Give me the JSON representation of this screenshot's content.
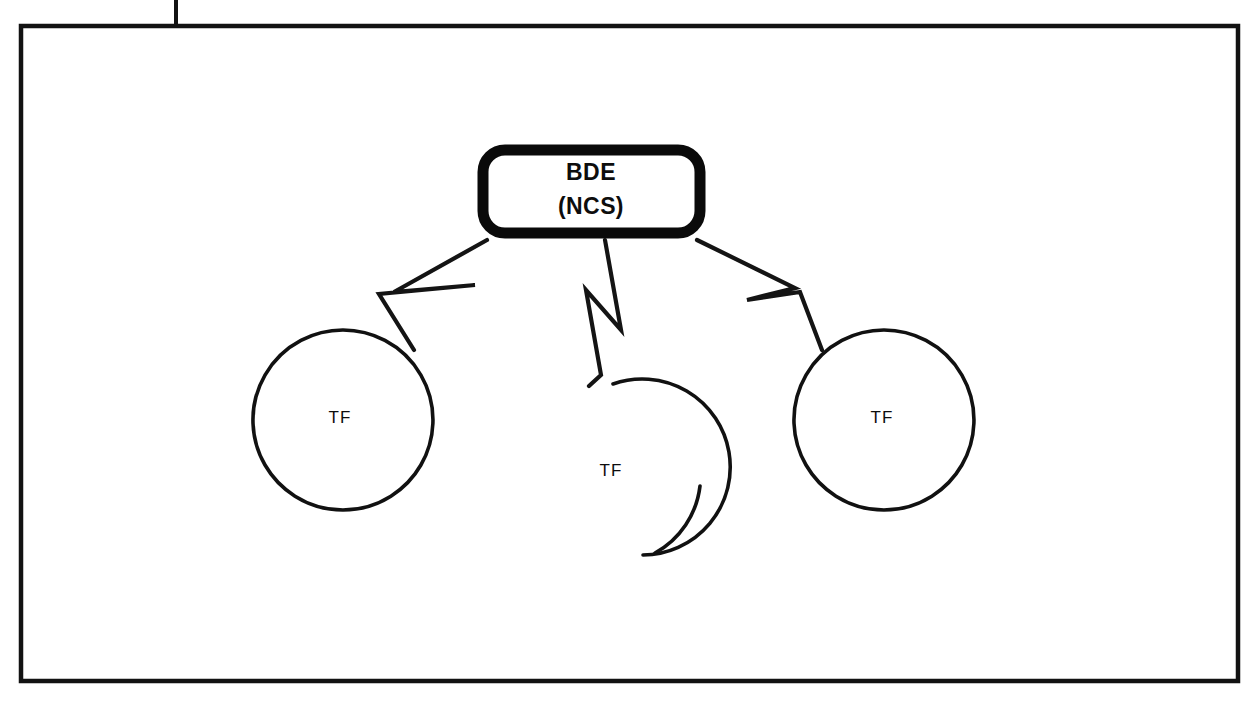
{
  "figure": {
    "kind": "network-topology-diagram",
    "frame": {
      "visible": true,
      "stub_at_top": true,
      "stroke_color": "#121212"
    },
    "colors": {
      "ink": "#111111",
      "paper": "#ffffff",
      "node_border": "#0a0a0a"
    }
  },
  "nodes": {
    "control_station": {
      "id": "bde-ncs",
      "shape": "rounded-rectangle",
      "emphasis": "thick-border",
      "line1": "BDE",
      "line2": "(NCS)",
      "x": 591,
      "y": 191,
      "width": 227,
      "height": 93
    },
    "subscribers": [
      {
        "id": "tf-left",
        "shape": "circle",
        "label": "TF",
        "cx": 343,
        "cy": 420,
        "r": 90
      },
      {
        "id": "tf-center",
        "shape": "circle",
        "label": "TF",
        "cx": 613,
        "cy": 472,
        "r": 88
      },
      {
        "id": "tf-right",
        "shape": "circle",
        "label": "TF",
        "cx": 884,
        "cy": 420,
        "r": 90
      }
    ]
  },
  "links": [
    {
      "id": "link-bde-tf-left",
      "from": "bde-ncs",
      "to": "tf-left",
      "style": "lightning-bolt",
      "meaning": "radio link"
    },
    {
      "id": "link-bde-tf-center",
      "from": "bde-ncs",
      "to": "tf-center",
      "style": "lightning-bolt",
      "meaning": "radio link"
    },
    {
      "id": "link-bde-tf-right",
      "from": "bde-ncs",
      "to": "tf-right",
      "style": "lightning-bolt",
      "meaning": "radio link"
    }
  ]
}
